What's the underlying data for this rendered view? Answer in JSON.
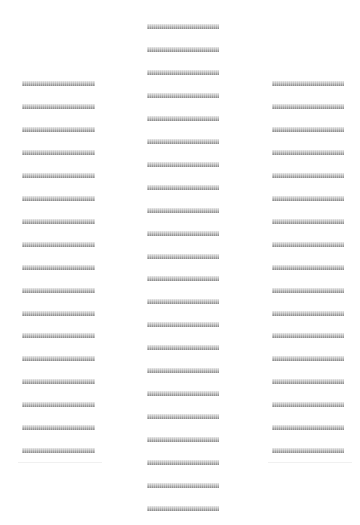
{
  "layout": {
    "bar_height": 5,
    "bar_spacing": 22.95,
    "bar_color_top": "#e4e4e4",
    "bar_color_bottom": "#8c8c8c",
    "background": "#ffffff"
  },
  "columns": [
    {
      "name": "left-column",
      "x": 22,
      "width": 73,
      "first_y": 81,
      "count": 17,
      "divider_y": 462,
      "divider_x": 18,
      "divider_width": 84
    },
    {
      "name": "center-column",
      "x": 147,
      "width": 72,
      "first_y": 24,
      "count": 22,
      "divider_y": null
    },
    {
      "name": "right-column",
      "x": 272,
      "width": 72,
      "first_y": 81,
      "count": 17,
      "divider_y": 462,
      "divider_x": 268,
      "divider_width": 84
    }
  ]
}
